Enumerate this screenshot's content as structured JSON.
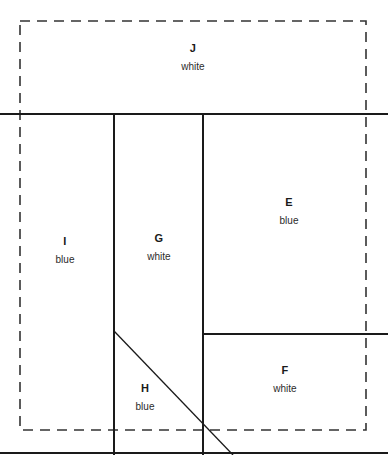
{
  "figure": {
    "width": 388,
    "height": 455,
    "background_color": "#ffffff",
    "stroke_color": "#1a1a1a",
    "dashed_stroke_color": "#333333"
  },
  "dashed_boundary": {
    "name": "dashed-outline-rect",
    "x": 20,
    "y": 21,
    "width": 346,
    "height": 409,
    "dash_pattern": "10 7",
    "stroke_width": 1.6
  },
  "solid_lines": [
    {
      "name": "horizontal-divider-top",
      "x1": 0,
      "y1": 114,
      "x2": 388,
      "y2": 114
    },
    {
      "name": "vertical-divider-left",
      "x1": 114,
      "y1": 114,
      "x2": 114,
      "y2": 455
    },
    {
      "name": "vertical-divider-right",
      "x1": 203,
      "y1": 114,
      "x2": 203,
      "y2": 455
    },
    {
      "name": "horizontal-divider-ef",
      "x1": 203,
      "y1": 334,
      "x2": 388,
      "y2": 334
    },
    {
      "name": "diagonal-divider-gh",
      "x1": 114,
      "y1": 331,
      "x2": 233,
      "y2": 455
    },
    {
      "name": "bottom-border-line",
      "x1": 0,
      "y1": 453,
      "x2": 388,
      "y2": 453
    }
  ],
  "regions": [
    {
      "id": "J",
      "letter": "J",
      "color": "white",
      "label_x": 193,
      "label_y": 58
    },
    {
      "id": "E",
      "letter": "E",
      "color": "blue",
      "label_x": 289,
      "label_y": 212
    },
    {
      "id": "I",
      "letter": "I",
      "color": "blue",
      "label_x": 65,
      "label_y": 251
    },
    {
      "id": "G",
      "letter": "G",
      "color": "white",
      "label_x": 159,
      "label_y": 248
    },
    {
      "id": "F",
      "letter": "F",
      "color": "white",
      "label_x": 285,
      "label_y": 380
    },
    {
      "id": "H",
      "letter": "H",
      "color": "blue",
      "label_x": 145,
      "label_y": 398
    }
  ]
}
